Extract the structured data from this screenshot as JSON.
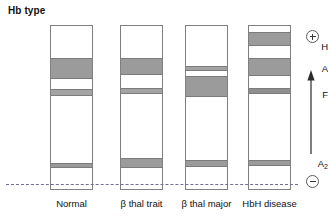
{
  "figure": {
    "title": "Hb type",
    "origin_line_label": "origin"
  },
  "row_labels": [
    {
      "name": "H",
      "text": "H",
      "y": 41
    },
    {
      "name": "A",
      "text": "A",
      "y": 63
    },
    {
      "name": "F",
      "text": "F",
      "y": 89
    },
    {
      "name": "A2",
      "text": "A",
      "sub": "2",
      "y": 158
    }
  ],
  "polarity": {
    "positive_symbol": "+",
    "positive_name": "anode-positive-electrode",
    "negative_symbol": "−",
    "negative_name": "cathode-negative-electrode",
    "arrow_name": "migration-direction-arrow"
  },
  "lanes": [
    {
      "name": "normal",
      "caption": "Normal",
      "x": 50,
      "width": 43,
      "bands": [
        {
          "hb": "A",
          "top": 32,
          "height": 21,
          "shade": "#9b9b9b"
        },
        {
          "hb": "F",
          "top": 63,
          "height": 7,
          "shade": "#a3a3a3"
        },
        {
          "hb": "A2",
          "top": 137,
          "height": 5,
          "shade": "#9b9b9b"
        }
      ]
    },
    {
      "name": "beta-thal-trait",
      "caption": "β thal trait",
      "x": 120,
      "width": 43,
      "bands": [
        {
          "hb": "A",
          "top": 32,
          "height": 17,
          "shade": "#9b9b9b"
        },
        {
          "hb": "F",
          "top": 62,
          "height": 6,
          "shade": "#a3a3a3"
        },
        {
          "hb": "A2",
          "top": 132,
          "height": 10,
          "shade": "#9b9b9b"
        }
      ]
    },
    {
      "name": "beta-thal-major",
      "caption": "β thal major",
      "x": 185,
      "width": 43,
      "bands": [
        {
          "hb": "A",
          "top": 40,
          "height": 5,
          "shade": "#a3a3a3"
        },
        {
          "hb": "F",
          "top": 50,
          "height": 21,
          "shade": "#9b9b9b"
        },
        {
          "hb": "A2",
          "top": 134,
          "height": 7,
          "shade": "#9b9b9b"
        }
      ]
    },
    {
      "name": "hbh-disease",
      "caption": "HbH disease",
      "x": 248,
      "width": 43,
      "bands": [
        {
          "hb": "H",
          "top": 6,
          "height": 14,
          "shade": "#9b9b9b"
        },
        {
          "hb": "A",
          "top": 32,
          "height": 18,
          "shade": "#9b9b9b"
        },
        {
          "hb": "F",
          "top": 62,
          "height": 6,
          "shade": "#8f8f8f"
        },
        {
          "hb": "A2",
          "top": 134,
          "height": 6,
          "shade": "#9b9b9b"
        }
      ]
    }
  ]
}
